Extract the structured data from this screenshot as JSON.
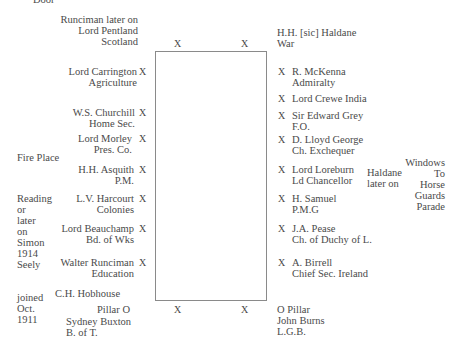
{
  "top_label": "Door",
  "table": {
    "top_left_x": "X",
    "top_right_x": "X",
    "bottom_left_x": "X",
    "bottom_right_x": "X"
  },
  "left_seats": [
    {
      "name": "Runciman later on",
      "name2": "Lord Pentland",
      "office": "Scotland"
    },
    {
      "name": "Lord Carrington",
      "office": "Agriculture",
      "mark": "X"
    },
    {
      "name": "W.S. Churchill",
      "office": "Home Sec.",
      "mark": "X"
    },
    {
      "name": "Lord Morley",
      "office": "Pres. Co.",
      "mark": "X"
    },
    {
      "name": "H.H. Asquith",
      "office": "P.M.",
      "mark": "X"
    },
    {
      "name": "L.V. Harcourt",
      "office": "Colonies",
      "mark": "X"
    },
    {
      "name": "Lord Beauchamp",
      "office": "Bd. of Wks",
      "mark": "X"
    },
    {
      "name": "Walter Runciman",
      "office": "Education",
      "mark": "X"
    }
  ],
  "right_seats": [
    {
      "name": "H.H. [sic] Haldane",
      "office": "War"
    },
    {
      "name": "R. McKenna",
      "office": "Admiralty",
      "mark": "X"
    },
    {
      "name": "Lord Crewe India",
      "office": "",
      "mark": "X"
    },
    {
      "name": "Sir Edward Grey",
      "office": "F.O.",
      "mark": "X"
    },
    {
      "name": "D. Lloyd George",
      "office": "Ch. Exchequer",
      "mark": "X"
    },
    {
      "name": "Lord Loreburn",
      "office": "Ld Chancellor",
      "mark": "X"
    },
    {
      "name": "H. Samuel",
      "office": "P.M.G",
      "mark": "X"
    },
    {
      "name": "J.A. Pease",
      "office": "Ch. of Duchy of L.",
      "mark": "X"
    },
    {
      "name": "A. Birrell",
      "office": "Chief Sec. Ireland",
      "mark": "X"
    }
  ],
  "annotations": {
    "fire_place": "Fire Place",
    "reading_note": [
      "Reading",
      "or",
      "later",
      "on",
      "Simon",
      "1914",
      "Seely"
    ],
    "joined_note": [
      "joined",
      "Oct.",
      "1911"
    ],
    "hobhouse": "C.H. Hobhouse",
    "pillar_left": "Pillar O",
    "buxton_name": "Sydney Buxton",
    "buxton_office": "B. of T.",
    "pillar_right": "O Pillar",
    "burns_name": "John Burns",
    "burns_office": "L.G.B.",
    "haldane_note": [
      "Haldane",
      "later on"
    ],
    "windows_note": [
      "Windows",
      "To",
      "Horse",
      "Guards",
      "Parade"
    ]
  }
}
